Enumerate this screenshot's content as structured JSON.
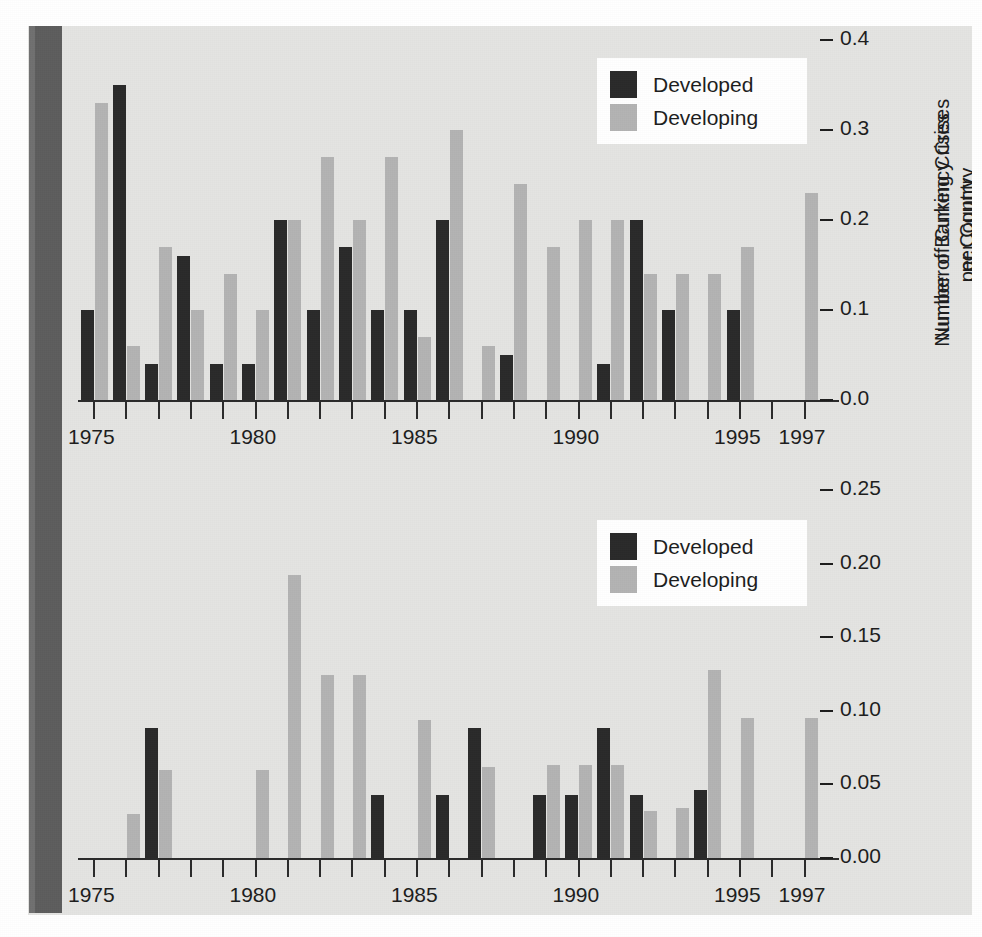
{
  "figure": {
    "background_color": "#e4e4e2",
    "developed_color": "#2a2a2a",
    "developing_color": "#b3b3b3"
  },
  "legend": {
    "developed_label": "Developed",
    "developing_label": "Developing"
  },
  "chart_data": [
    {
      "type": "bar",
      "id": "currency-crises",
      "title": "",
      "ylabel_line1": "Number of Currency Crises",
      "ylabel_line2": "per Country",
      "xlabel": "",
      "ylim": [
        0.0,
        0.4
      ],
      "ytick_labels": [
        "0.4",
        "0.3",
        "0.2",
        "0.1",
        "0.0"
      ],
      "ytick_values": [
        0.4,
        0.3,
        0.2,
        0.1,
        0.0
      ],
      "xtick_labels": [
        "1975",
        "1980",
        "1985",
        "1990",
        "1995",
        "1997"
      ],
      "xtick_values": [
        1975,
        1980,
        1985,
        1990,
        1995,
        1997
      ],
      "grid": false,
      "legend_position": "top-right",
      "categories": [
        1975,
        1976,
        1977,
        1978,
        1979,
        1980,
        1981,
        1982,
        1983,
        1984,
        1985,
        1986,
        1987,
        1988,
        1989,
        1990,
        1991,
        1992,
        1993,
        1994,
        1995,
        1996,
        1997
      ],
      "series": [
        {
          "name": "Developed",
          "values": [
            0.1,
            0.35,
            0.04,
            0.16,
            0.04,
            0.04,
            0.2,
            0.1,
            0.17,
            0.1,
            0.1,
            0.2,
            0.0,
            0.05,
            0.0,
            0.0,
            0.04,
            0.2,
            0.1,
            0.0,
            0.1,
            0.0,
            0.0
          ]
        },
        {
          "name": "Developing",
          "values": [
            0.33,
            0.06,
            0.17,
            0.1,
            0.14,
            0.1,
            0.2,
            0.27,
            0.2,
            0.27,
            0.07,
            0.3,
            0.06,
            0.24,
            0.17,
            0.2,
            0.2,
            0.14,
            0.14,
            0.14,
            0.17,
            0.0,
            0.23
          ]
        }
      ]
    },
    {
      "type": "bar",
      "id": "banking-crises",
      "title": "",
      "ylabel_line1": "Number of Banking Crises",
      "ylabel_line2": "per Country",
      "xlabel": "",
      "ylim": [
        0.0,
        0.25
      ],
      "ytick_labels": [
        "0.25",
        "0.20",
        "0.15",
        "0.10",
        "0.05",
        "0.00"
      ],
      "ytick_values": [
        0.25,
        0.2,
        0.15,
        0.1,
        0.05,
        0.0
      ],
      "xtick_labels": [
        "1975",
        "1980",
        "1985",
        "1990",
        "1995",
        "1997"
      ],
      "xtick_values": [
        1975,
        1980,
        1985,
        1990,
        1995,
        1997
      ],
      "grid": false,
      "legend_position": "top-right",
      "categories": [
        1975,
        1976,
        1977,
        1978,
        1979,
        1980,
        1981,
        1982,
        1983,
        1984,
        1985,
        1986,
        1987,
        1988,
        1989,
        1990,
        1991,
        1992,
        1993,
        1994,
        1995,
        1996,
        1997
      ],
      "series": [
        {
          "name": "Developed",
          "values": [
            0.0,
            0.0,
            0.088,
            0.0,
            0.0,
            0.0,
            0.0,
            0.0,
            0.0,
            0.043,
            0.0,
            0.043,
            0.088,
            0.0,
            0.043,
            0.043,
            0.088,
            0.043,
            0.0,
            0.046,
            0.0,
            0.0,
            0.0
          ]
        },
        {
          "name": "Developing",
          "values": [
            0.0,
            0.03,
            0.06,
            0.0,
            0.0,
            0.06,
            0.192,
            0.124,
            0.124,
            0.0,
            0.094,
            0.0,
            0.062,
            0.0,
            0.063,
            0.063,
            0.063,
            0.032,
            0.034,
            0.128,
            0.095,
            0.0,
            0.095
          ]
        }
      ]
    }
  ]
}
